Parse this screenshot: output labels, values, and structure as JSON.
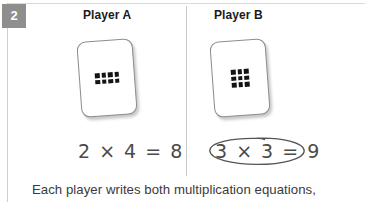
{
  "step": {
    "number": "2"
  },
  "columns": [
    {
      "header": "Player A",
      "card": {
        "dot_rows": 2,
        "dot_cols": 4,
        "dot_total": 8
      },
      "equation": "2 × 4 = 8",
      "circled": false
    },
    {
      "header": "Player B",
      "card": {
        "dot_rows": 3,
        "dot_cols": 3,
        "dot_total": 9
      },
      "equation": "3 × 3 = 9",
      "circled": true
    }
  ],
  "caption": "Each player writes both multiplication equations,",
  "colors": {
    "badge_background": "#8e8e8e",
    "badge_text": "#ffffff",
    "header_text": "#1a1a1a",
    "equation_text": "#4a4a4a",
    "caption_text": "#3a3a3a",
    "card_border": "#8d8d8d",
    "dot_fill": "#141414",
    "rule": "#cfcfcf",
    "circle_mark": "#555555",
    "page_background": "#ffffff"
  }
}
